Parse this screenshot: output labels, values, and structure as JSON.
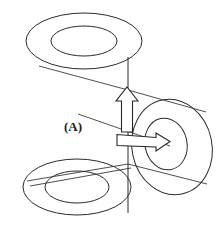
{
  "figure": {
    "background_color": "#ffffff",
    "line_color": "#2b2b2b",
    "canvas": {
      "width": 222,
      "height": 225
    },
    "labels": [
      {
        "id": "A",
        "text": "(A)",
        "x": 64,
        "y": 131,
        "font_size": 13
      }
    ],
    "annuli": [
      {
        "name": "top-left-annulus",
        "outer": {
          "cx": 84,
          "cy": 41,
          "rx": 58,
          "ry": 28,
          "rotate": 0
        },
        "inner": {
          "cx": 84,
          "cy": 41,
          "rx": 33,
          "ry": 15,
          "rotate": 0
        }
      },
      {
        "name": "bottom-left-annulus",
        "outer": {
          "cx": 77,
          "cy": 187,
          "rx": 54,
          "ry": 28,
          "rotate": 0
        },
        "inner": {
          "cx": 77,
          "cy": 187,
          "rx": 32,
          "ry": 16,
          "rotate": 0
        }
      },
      {
        "name": "right-annulus",
        "outer": {
          "cx": 172,
          "cy": 147,
          "rx": 40,
          "ry": 48,
          "rotate": -12
        },
        "inner": {
          "cx": 166,
          "cy": 144,
          "rx": 21,
          "ry": 26,
          "rotate": -12
        }
      }
    ],
    "axis_line": {
      "name": "central-vertical-axis",
      "x1": 128,
      "y1": 57,
      "x2": 128,
      "y2": 213
    },
    "connector_lines": [
      {
        "name": "upper-left-tangent",
        "x1": 39,
        "y1": 66,
        "x2": 128,
        "y2": 90
      },
      {
        "name": "upper-right-tangent",
        "x1": 128,
        "y1": 90,
        "x2": 204,
        "y2": 111
      },
      {
        "name": "label-pointer-line",
        "x1": 78,
        "y1": 114,
        "x2": 168,
        "y2": 145
      },
      {
        "name": "lower-left-tangent-outer",
        "x1": 28,
        "y1": 180,
        "x2": 128,
        "y2": 165
      },
      {
        "name": "lower-left-tangent-inner",
        "x1": 30,
        "y1": 184,
        "x2": 132,
        "y2": 168
      },
      {
        "name": "lower-right-tangent",
        "x1": 128,
        "y1": 165,
        "x2": 205,
        "y2": 183
      }
    ],
    "arrows": [
      {
        "name": "vertical-up-arrow",
        "direction": "up",
        "tip_x": 127,
        "tip_y": 87,
        "tail_y": 131,
        "shaft_half_width": 6,
        "head_half_width": 11,
        "head_length": 14
      },
      {
        "name": "horizontal-right-arrow",
        "direction": "right",
        "tip_x": 168,
        "tip_y": 141,
        "tail_x": 116,
        "shaft_half_width": 5,
        "head_half_width": 9,
        "head_length": 13
      }
    ]
  }
}
